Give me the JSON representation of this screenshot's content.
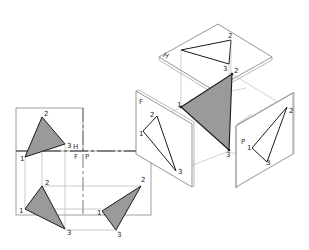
{
  "diagram": {
    "title": "",
    "planes": {
      "horizontal": "H",
      "frontal": "F",
      "profile": "P"
    },
    "fold_lines": {
      "hf_top": "H",
      "hf_bottom": "F",
      "fp": "P"
    },
    "points": [
      "1",
      "2",
      "3"
    ],
    "colors": {
      "fill": "#9a9a9a",
      "line": "#1a1a1a",
      "construction": "#aaaaaa",
      "plane_edge": "#777777"
    }
  }
}
